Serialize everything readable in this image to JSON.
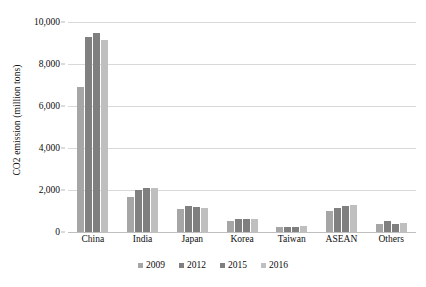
{
  "chart_data": {
    "type": "bar",
    "title": "",
    "subtitle": "",
    "xlabel": "",
    "ylabel": "CO2 emission (million tons)",
    "categories": [
      "China",
      "India",
      "Japan",
      "Korea",
      "Taiwan",
      "ASEAN",
      "Others"
    ],
    "series": [
      {
        "name": "2009",
        "color": "#a6a6a6",
        "values": [
          6900,
          1650,
          1100,
          540,
          250,
          1000,
          400
        ]
      },
      {
        "name": "2012",
        "color": "#808080",
        "values": [
          9300,
          2000,
          1250,
          600,
          260,
          1150,
          520
        ]
      },
      {
        "name": "2015",
        "color": "#7f7f7f",
        "values": [
          9500,
          2100,
          1180,
          600,
          250,
          1230,
          400
        ]
      },
      {
        "name": "2016",
        "color": "#bfbfbf",
        "values": [
          9150,
          2100,
          1160,
          620,
          270,
          1300,
          420
        ]
      }
    ],
    "ylim": [
      0,
      10000
    ],
    "y_ticks": [
      0,
      2000,
      4000,
      6000,
      8000,
      10000
    ],
    "y_tick_labels": [
      "0",
      "2,000",
      "4,000",
      "6,000",
      "8,000",
      "10,000"
    ],
    "grid": true,
    "legend_position": "bottom",
    "legend_entries": [
      "2009",
      "2012",
      "2015",
      "2016"
    ]
  }
}
